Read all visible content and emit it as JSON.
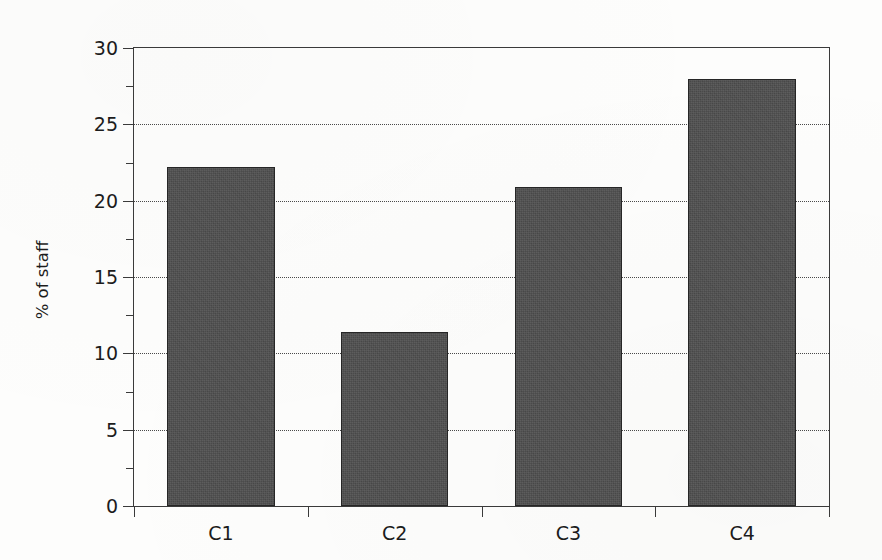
{
  "chart_data": {
    "type": "bar",
    "title": "",
    "subtitle": "",
    "xlabel": "",
    "ylabel": "% of staff",
    "categories": [
      "C1",
      "C2",
      "C3",
      "C4"
    ],
    "values": [
      22.2,
      11.4,
      20.9,
      28.0
    ],
    "ylim": [
      0,
      30
    ],
    "ytick_labels": [
      "0",
      "5",
      "10",
      "15",
      "20",
      "25",
      "30"
    ],
    "ytick_values": [
      0,
      5,
      10,
      15,
      20,
      25,
      30
    ],
    "yminor_tick_values": [
      2.5,
      7.5,
      12.5,
      17.5,
      22.5,
      27.5
    ],
    "gridlines": {
      "axis": "y",
      "values": [
        5,
        10,
        15,
        20,
        25
      ],
      "style": "dotted",
      "color": "#4a4a4a"
    },
    "legend": null,
    "legend_position": "none",
    "bar_color": "#4b4b4b",
    "bar_edge_color": "#262626",
    "axis_color": "#3a3a3a",
    "background_color": "#fdfdfc",
    "bar_width_fraction": 0.62
  }
}
